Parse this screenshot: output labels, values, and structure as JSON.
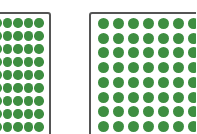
{
  "colors": {
    "background": "#ffffff",
    "border": "#555555",
    "dot": "#3e8e41"
  },
  "panels": [
    {
      "name": "left-dot-grid",
      "box": {
        "x": -10,
        "y": 12,
        "w": 61,
        "h": 140
      },
      "dot_diameter": 9.5,
      "columns_x": [
        -3,
        7.5,
        18,
        28.5,
        39
      ],
      "rows_y": [
        23,
        36,
        49,
        62,
        75,
        88,
        101,
        114,
        127
      ],
      "dot_count_visible": 45
    },
    {
      "name": "right-dot-grid",
      "box": {
        "x": 89,
        "y": 12,
        "w": 130,
        "h": 140
      },
      "dot_diameter": 11,
      "columns_x": [
        103,
        118,
        133,
        148,
        163,
        178,
        193
      ],
      "rows_y": [
        23,
        38,
        52.5,
        67,
        82,
        97,
        111.5,
        126.5
      ],
      "dot_count_visible": 56
    }
  ]
}
